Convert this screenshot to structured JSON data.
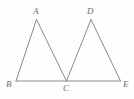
{
  "figure": {
    "background_color": "#fefefe",
    "stroke_color": "#8a8a8a",
    "label_color": "#6b6b6b",
    "stroke_width": 1,
    "width": 134,
    "height": 99,
    "points": {
      "A": {
        "label": "A",
        "x": 36.5,
        "y": 19.5,
        "label_x": 33,
        "label_y": 7
      },
      "B": {
        "label": "B",
        "x": 16.0,
        "y": 81.0,
        "label_x": 6,
        "label_y": 80
      },
      "C": {
        "label": "C",
        "x": 66.5,
        "y": 81.0,
        "label_x": 63,
        "label_y": 84
      },
      "D": {
        "label": "D",
        "x": 91.0,
        "y": 19.5,
        "label_x": 87,
        "label_y": 7
      },
      "E": {
        "label": "E",
        "x": 120.5,
        "y": 81.0,
        "label_x": 123,
        "label_y": 80
      }
    },
    "segments": [
      {
        "name": "segment-BE",
        "from": "B",
        "to": "E"
      },
      {
        "name": "segment-AB",
        "from": "B",
        "to": "A"
      },
      {
        "name": "segment-AC",
        "from": "A",
        "to": "C"
      },
      {
        "name": "segment-DC",
        "from": "C",
        "to": "D"
      },
      {
        "name": "segment-DE",
        "from": "D",
        "to": "E"
      }
    ]
  }
}
